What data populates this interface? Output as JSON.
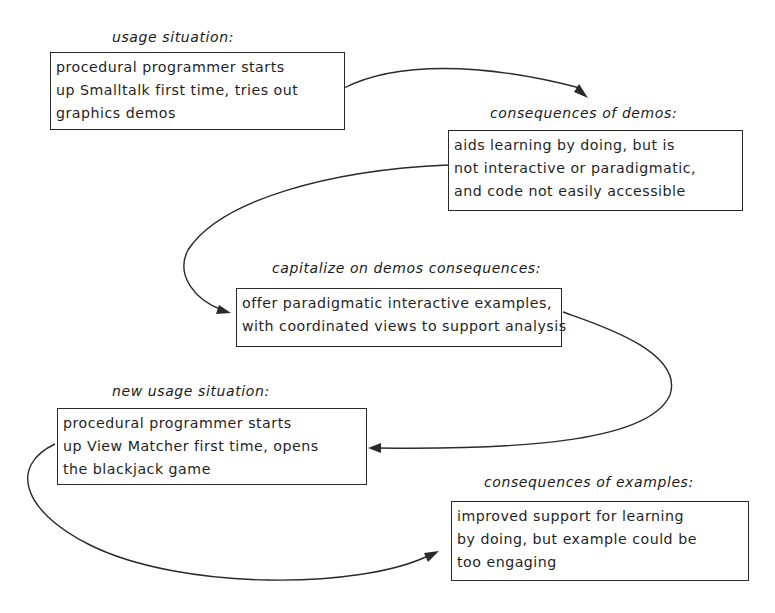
{
  "diagram": {
    "nodes": [
      {
        "id": "usage-situation",
        "label": "usage situation:",
        "lines": [
          "procedural programmer starts",
          "up Smalltalk first time, tries out",
          "graphics demos"
        ]
      },
      {
        "id": "consequences-of-demos",
        "label": "consequences of demos:",
        "lines": [
          "aids learning by doing, but is",
          "not interactive or paradigmatic,",
          "and code not easily accessible"
        ]
      },
      {
        "id": "capitalize-on-demos-consequences",
        "label": "capitalize on demos consequences:",
        "lines": [
          "offer paradigmatic interactive examples,",
          "with coordinated views to support analysis"
        ]
      },
      {
        "id": "new-usage-situation",
        "label": "new usage situation:",
        "lines": [
          "procedural programmer starts",
          "up View Matcher first time, opens",
          "the blackjack game"
        ]
      },
      {
        "id": "consequences-of-examples",
        "label": "consequences of examples:",
        "lines": [
          "improved support for learning",
          "by doing, but example could be",
          "too engaging"
        ]
      }
    ],
    "edges": [
      {
        "from": "usage-situation",
        "to": "consequences-of-demos"
      },
      {
        "from": "consequences-of-demos",
        "to": "capitalize-on-demos-consequences"
      },
      {
        "from": "capitalize-on-demos-consequences",
        "to": "new-usage-situation"
      },
      {
        "from": "new-usage-situation",
        "to": "consequences-of-examples"
      }
    ],
    "colors": {
      "ink": "#1f1f1f",
      "background": "#ffffff"
    }
  }
}
